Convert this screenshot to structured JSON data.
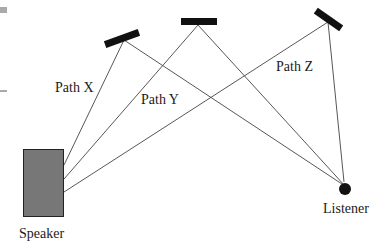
{
  "labels": {
    "path_x": "Path X",
    "path_y": "Path Y",
    "path_z": "Path Z",
    "speaker": "Speaker",
    "listener": "Listener"
  },
  "colors": {
    "speaker_fill": "#777777",
    "mirror": "#111111",
    "line": "#444444",
    "listener": "#111111",
    "corner_mark": "#aaaaaa"
  }
}
